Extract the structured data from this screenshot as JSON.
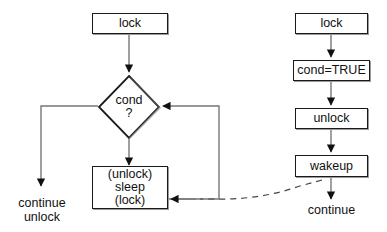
{
  "diagram": {
    "type": "flowchart",
    "background_color": "#ffffff",
    "line_color": "#555555",
    "arrow_color": "#111111",
    "box_border_color": "#1a1a1a",
    "left_column": {
      "name": "waiter-thread",
      "nodes": [
        {
          "id": "left-lock",
          "label": "lock",
          "shape": "rect"
        },
        {
          "id": "cond-decision",
          "label": "cond\n?",
          "shape": "diamond"
        },
        {
          "id": "sleep-block",
          "label": "(unlock)\nsleep\n(lock)",
          "shape": "rect"
        }
      ],
      "terminal": {
        "id": "continue-unlock",
        "label": "continue\nunlock"
      }
    },
    "right_column": {
      "name": "signaler-thread",
      "nodes": [
        {
          "id": "right-lock",
          "label": "lock",
          "shape": "rect"
        },
        {
          "id": "cond-true",
          "label": "cond=TRUE",
          "shape": "rect"
        },
        {
          "id": "right-unlock",
          "label": "unlock",
          "shape": "rect"
        },
        {
          "id": "wakeup",
          "label": "wakeup",
          "shape": "rect"
        }
      ],
      "terminal": {
        "id": "continue",
        "label": "continue"
      }
    },
    "edges": [
      {
        "id": "edge-lock-to-cond",
        "from": "left-lock",
        "to": "cond-decision",
        "style": "solid",
        "arrow": true
      },
      {
        "id": "edge-cond-to-continue",
        "from": "cond-decision",
        "to": "continue-unlock",
        "style": "solid",
        "arrow": true
      },
      {
        "id": "edge-cond-to-sleep",
        "from": "cond-decision",
        "to": "sleep-block",
        "style": "solid",
        "arrow": true
      },
      {
        "id": "edge-sleep-loop-back",
        "from": "sleep-block",
        "to": "cond-decision",
        "style": "solid",
        "arrow": true
      },
      {
        "id": "edge-loop-into-sleep",
        "from": "loop-rail",
        "to": "sleep-block",
        "style": "solid",
        "arrow": true
      },
      {
        "id": "edge-right-lock-to-cond-true",
        "from": "right-lock",
        "to": "cond-true",
        "style": "solid",
        "arrow": true
      },
      {
        "id": "edge-cond-true-to-unlock",
        "from": "cond-true",
        "to": "right-unlock",
        "style": "solid",
        "arrow": true
      },
      {
        "id": "edge-unlock-to-wakeup",
        "from": "right-unlock",
        "to": "wakeup",
        "style": "solid",
        "arrow": true
      },
      {
        "id": "edge-wakeup-to-continue",
        "from": "wakeup",
        "to": "continue",
        "style": "solid",
        "arrow": true
      },
      {
        "id": "edge-wakeup-to-sleep-dashed",
        "from": "wakeup",
        "to": "sleep-block",
        "style": "dashed",
        "arrow": true
      }
    ]
  }
}
